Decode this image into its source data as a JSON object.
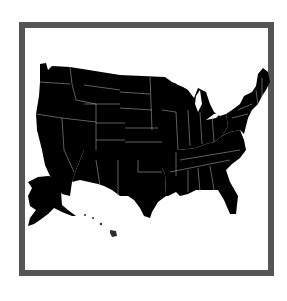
{
  "map": {
    "title": "United States regions map",
    "frame_color": "#555555",
    "regions": [
      {
        "name": "West",
        "color": "#2c2c2c",
        "states": [
          "WA",
          "OR",
          "CA",
          "NV",
          "ID",
          "MT",
          "WY",
          "UT",
          "CO",
          "AK",
          "HI"
        ]
      },
      {
        "name": "Midwest",
        "color": "#a6a6a6",
        "states": [
          "ND",
          "SD",
          "NE",
          "KS",
          "MN",
          "IA",
          "MO",
          "WI",
          "IL",
          "MI",
          "IN",
          "OH"
        ]
      },
      {
        "name": "Southwest",
        "color": "#a6a6a6",
        "states": [
          "AZ",
          "NM",
          "OK",
          "TX"
        ]
      },
      {
        "name": "Southeast",
        "color": "#6b6b6b",
        "states": [
          "AR",
          "LA",
          "MS",
          "AL",
          "GA",
          "FL",
          "TN",
          "KY",
          "SC",
          "NC",
          "VA",
          "WV"
        ]
      },
      {
        "name": "Northeast",
        "color": "#5e5e5e",
        "states": [
          "PA",
          "NY",
          "NJ",
          "DE",
          "MD",
          "CT",
          "RI",
          "MA",
          "VT",
          "NH",
          "ME"
        ]
      }
    ]
  }
}
